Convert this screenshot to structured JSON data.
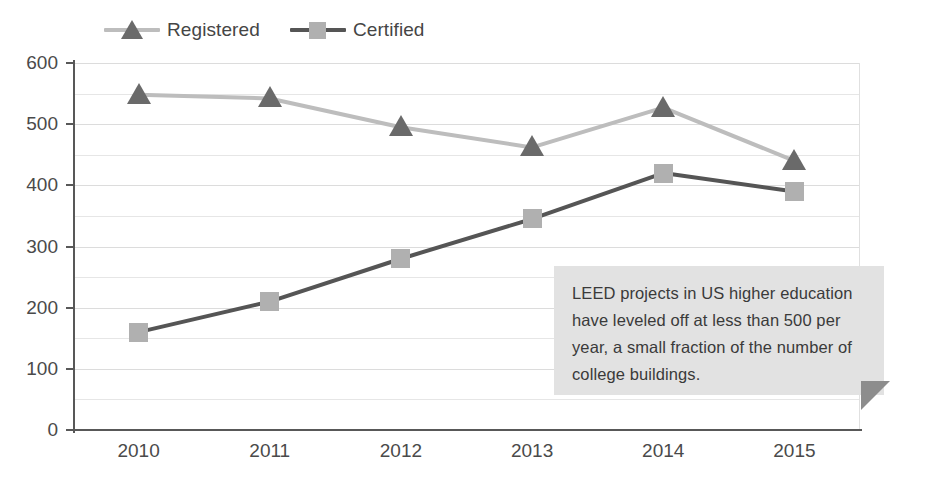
{
  "chart_data": {
    "type": "line",
    "title": "",
    "subtitle": "",
    "xlabel": "",
    "ylabel": "",
    "categories": [
      "2010",
      "2011",
      "2012",
      "2013",
      "2014",
      "2015"
    ],
    "series": [
      {
        "name": "Registered",
        "values": [
          548,
          542,
          495,
          462,
          527,
          440
        ],
        "line_color": "#bdbdbd",
        "marker_color": "#6a6a6a",
        "marker": "triangle"
      },
      {
        "name": "Certified",
        "values": [
          160,
          210,
          280,
          345,
          420,
          390
        ],
        "line_color": "#555555",
        "marker_color": "#b0b0b0",
        "marker": "square"
      }
    ],
    "ylim": [
      0,
      600
    ],
    "y_ticks": [
      0,
      100,
      200,
      300,
      400,
      500,
      600
    ],
    "y_tick_labels": [
      "0",
      "100",
      "200",
      "300",
      "400",
      "500",
      "600"
    ],
    "y_minor_step": 50,
    "grid": true,
    "grid_color": "#e6e6e6",
    "legend_position": "top-left"
  },
  "legend": {
    "entries": [
      {
        "label": "Registered",
        "marker": "triangle-marker",
        "line_color": "#bdbdbd",
        "marker_color": "#6a6a6a"
      },
      {
        "label": "Certified",
        "marker": "square-marker",
        "line_color": "#555555",
        "marker_color": "#b0b0b0"
      }
    ]
  },
  "callout": {
    "text": "LEED projects in US higher education have leveled off at less than 500 per year, a small fraction of the number of college buildings.",
    "background": "#e2e2e2",
    "tail_color": "#8d8d8d"
  }
}
